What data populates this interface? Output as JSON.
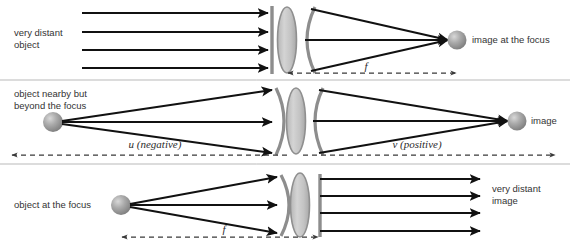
{
  "diagram": {
    "background_color": "#ffffff",
    "ray_color": "#111111",
    "wavefront_color": "#8d8d8d",
    "lens_fill_color": "#c9c9c9",
    "sphere_color": "#9a9a9a",
    "text_color": "#333333",
    "rows": [
      {
        "id": "row-very-distant-object",
        "left_label": "very distant\nobject",
        "left_label_line1": "very distant",
        "left_label_line2": "object",
        "right_label": "image at the focus",
        "distance_label": "f",
        "incoming_wavefront": "flat",
        "outgoing_wavefront": "converging-arc",
        "ray_count": 4,
        "object_type": "none",
        "image_type": "sphere"
      },
      {
        "id": "row-object-beyond-focus",
        "left_label_line1": "object nearby but",
        "left_label_line2": "beyond the focus",
        "right_label": "image",
        "distance_label_left": "u (negative)",
        "distance_label_left_symbol": "u",
        "distance_label_left_sign": "(negative)",
        "distance_label_right": "v (positive)",
        "distance_label_right_symbol": "v",
        "distance_label_right_sign": "(positive)",
        "incoming_wavefront": "diverging-arc",
        "outgoing_wavefront": "converging-arc",
        "ray_count": 3,
        "object_type": "sphere",
        "image_type": "sphere"
      },
      {
        "id": "row-object-at-focus",
        "left_label": "object at the focus",
        "right_label_line1": "very distant",
        "right_label_line2": "image",
        "distance_label": "f",
        "incoming_wavefront": "diverging-arc",
        "outgoing_wavefront": "flat",
        "ray_count": 4,
        "object_type": "sphere",
        "image_type": "none"
      }
    ]
  }
}
